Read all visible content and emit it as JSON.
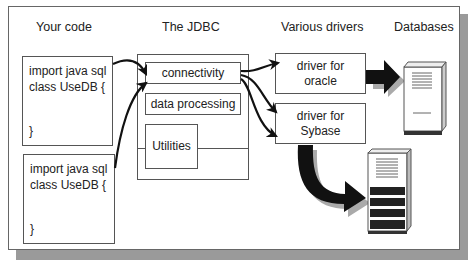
{
  "diagram": {
    "headers": {
      "your_code": "Your code",
      "jdbc": "The JDBC",
      "drivers": "Various drivers",
      "databases": "Databases"
    },
    "code_blocks": [
      {
        "line1": "import java sql",
        "line2": "class UseDB {",
        "close": "}"
      },
      {
        "line1": "import java sql",
        "line2": "class UseDB {",
        "close": "}"
      }
    ],
    "jdbc_components": {
      "connectivity": "connectivity",
      "data_processing": "data processing",
      "utilities": "Utilities"
    },
    "drivers": [
      {
        "line1": "driver for",
        "line2": "oracle"
      },
      {
        "line1": "driver for",
        "line2": "Sybase"
      }
    ],
    "databases": [
      {
        "name": "oracle-database-server"
      },
      {
        "name": "sybase-database-server"
      }
    ],
    "colors": {
      "line": "#555555",
      "arrow": "#111111",
      "shadow": "#9a9a9a"
    }
  }
}
